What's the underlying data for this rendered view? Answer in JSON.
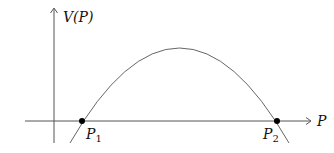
{
  "diagram": {
    "type": "function-graph",
    "y_axis_label": "V(P)",
    "x_axis_label": "P",
    "points": [
      {
        "name": "P",
        "subscript": "1",
        "x": 82,
        "y": 121
      },
      {
        "name": "P",
        "subscript": "2",
        "x": 277,
        "y": 121
      }
    ],
    "curve": "downward parabola crossing x-axis at P1 and P2",
    "colors": {
      "axis": "#555555",
      "curve": "#666666",
      "point": "#000000",
      "text": "#111111"
    }
  }
}
